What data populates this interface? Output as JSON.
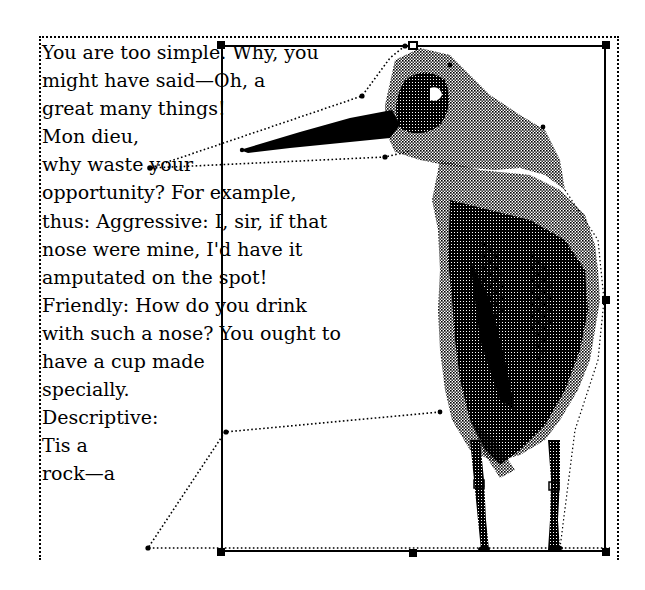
{
  "document": {
    "text_lines": [
      "You are too simple. Why, you",
      "might have said—Oh, a",
      "great many things!",
      "Mon dieu,",
      "why waste your",
      "opportunity? For example,",
      "thus: Aggressive: I, sir, if that",
      "nose were mine, I'd have it",
      "amputated on the spot!",
      "Friendly: How do you drink",
      "with such a nose? You ought to",
      "have a cup made",
      "specially.",
      "Descriptive:",
      "Tis a",
      "rock—a"
    ]
  },
  "image": {
    "subject": "heron-bitmap-illustration",
    "selected": true
  },
  "colors": {
    "ink": "#000000",
    "paper": "#ffffff"
  }
}
